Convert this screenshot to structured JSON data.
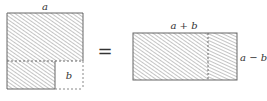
{
  "diagram": {
    "left_figure": {
      "side_label": "a",
      "cutout_label": "b"
    },
    "equals_sign": "=",
    "right_figure": {
      "width_label": "a + b",
      "height_label": "a − b"
    },
    "colors": {
      "stroke": "#666666",
      "hatch": "#888888",
      "background": "#ffffff"
    }
  }
}
